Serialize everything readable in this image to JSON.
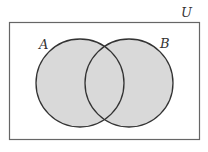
{
  "diagram": {
    "type": "venn",
    "universe_label": "U",
    "sets": [
      {
        "label": "A",
        "shaded": true
      },
      {
        "label": "B",
        "shaded": true
      }
    ],
    "shaded_region": "A ∪ B",
    "colors": {
      "fill": "#d9d9d9",
      "stroke": "#333333",
      "background": "#ffffff"
    }
  }
}
